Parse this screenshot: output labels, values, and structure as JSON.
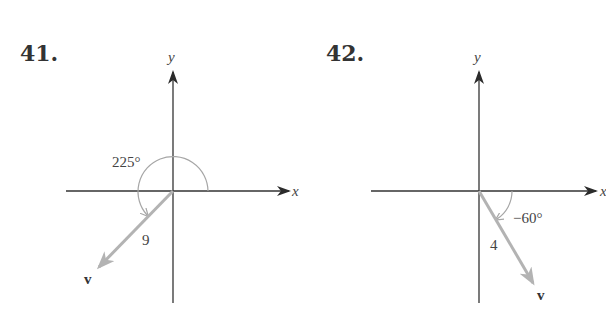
{
  "figures": [
    {
      "number": "41.",
      "x_axis_label": "x",
      "y_axis_label": "y",
      "angle_label": "225°",
      "angle_degrees": 225,
      "magnitude_label": "9",
      "magnitude": 9,
      "vector_label": "v"
    },
    {
      "number": "42.",
      "x_axis_label": "x",
      "y_axis_label": "y",
      "angle_label": "−60°",
      "angle_degrees": -60,
      "magnitude_label": "4",
      "magnitude": 4,
      "vector_label": "v"
    }
  ],
  "colors": {
    "axis": "#333333",
    "vector": "#b3b3b3",
    "arc": "#a6a6a6",
    "text": "#333333"
  }
}
